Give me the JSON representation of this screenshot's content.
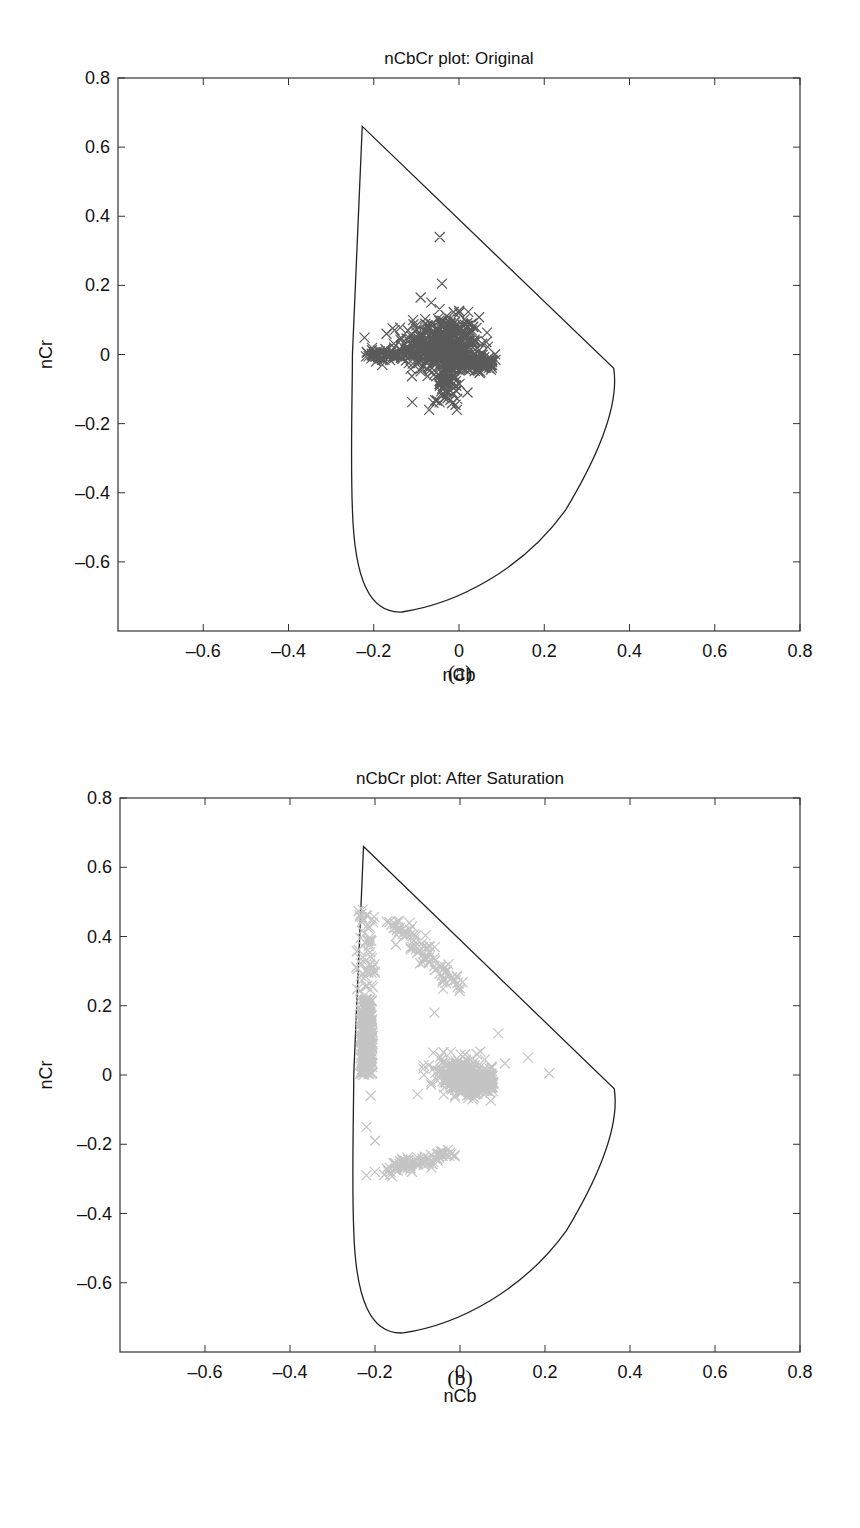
{
  "chart_data": [
    {
      "type": "scatter",
      "panel": "(a)",
      "title": "nCbCr plot: Original",
      "xlabel": "nCb",
      "ylabel": "nCr",
      "xlim": [
        -0.8,
        0.8
      ],
      "ylim": [
        -0.8,
        0.8
      ],
      "xticks": [
        "-0.6",
        "-0.4",
        "-0.2",
        "0",
        "0.2",
        "0.4",
        "0.6",
        "0.8"
      ],
      "yticks": [
        "0.8",
        "0.6",
        "0.4",
        "0.2",
        "0",
        "-0.2",
        "-0.4",
        "-0.6"
      ],
      "grid": false,
      "legend": null,
      "marker": "x",
      "marker_color": "#5a5a5a",
      "gamut_boundary": {
        "description": "closed gamut outline",
        "top_vertex": [
          -0.227,
          0.66
        ],
        "right_vertex": [
          0.363,
          -0.04
        ],
        "bottom": [
          -0.134,
          -0.745
        ],
        "left_edge_x_at_0": -0.25
      },
      "clusters": [
        {
          "name": "main-body",
          "cx": -0.04,
          "cy": 0.03,
          "sx": 0.045,
          "sy": 0.04,
          "n": 420
        },
        {
          "name": "horizontal-arm-left",
          "x_range": [
            -0.22,
            0.0
          ],
          "cy": 0.0,
          "sy": 0.01,
          "n": 120
        },
        {
          "name": "horizontal-arm-right",
          "x_range": [
            0.0,
            0.08
          ],
          "cy": -0.025,
          "sy": 0.012,
          "n": 110
        },
        {
          "name": "downward-stem",
          "cx": -0.03,
          "cy": -0.07,
          "sx": 0.015,
          "sy": 0.03,
          "n": 90
        }
      ],
      "outliers": [
        [
          -0.045,
          0.34
        ],
        [
          -0.04,
          0.205
        ],
        [
          -0.09,
          0.165
        ],
        [
          -0.065,
          0.15
        ],
        [
          -0.17,
          0.06
        ],
        [
          -0.2,
          0.0
        ],
        [
          -0.18,
          -0.03
        ],
        [
          -0.07,
          -0.16
        ],
        [
          -0.005,
          -0.16
        ],
        [
          -0.06,
          -0.14
        ],
        [
          0.02,
          -0.11
        ],
        [
          0.05,
          -0.05
        ],
        [
          0.03,
          0.09
        ],
        [
          0.0,
          0.12
        ]
      ]
    },
    {
      "type": "scatter",
      "panel": "(b)",
      "title": "nCbCr plot: After Saturation",
      "xlabel": "nCb",
      "ylabel": "nCr",
      "xlim": [
        -0.8,
        0.8
      ],
      "ylim": [
        -0.8,
        0.8
      ],
      "xticks": [
        "-0.6",
        "-0.4",
        "-0.2",
        "0",
        "0.2",
        "0.4",
        "0.6",
        "0.8"
      ],
      "yticks": [
        "0.8",
        "0.6",
        "0.4",
        "0.2",
        "0",
        "-0.2",
        "-0.4",
        "-0.6"
      ],
      "grid": false,
      "legend": null,
      "marker": "x",
      "marker_color": "#c4c4c4",
      "gamut_boundary": {
        "description": "closed gamut outline",
        "top_vertex": [
          -0.227,
          0.66
        ],
        "right_vertex": [
          0.363,
          -0.04
        ],
        "bottom": [
          -0.134,
          -0.745
        ],
        "left_edge_x_at_0": -0.25
      },
      "clusters": [
        {
          "name": "left-edge-band",
          "x_range": [
            -0.235,
            -0.205
          ],
          "y_range": [
            0.0,
            0.22
          ],
          "n": 260
        },
        {
          "name": "left-edge-upper",
          "x_range": [
            -0.245,
            -0.2
          ],
          "y_range": [
            0.22,
            0.48
          ],
          "n": 60
        },
        {
          "name": "upper-diagonal",
          "from": [
            -0.17,
            0.46
          ],
          "to": [
            -0.01,
            0.26
          ],
          "spread": 0.012,
          "n": 90
        },
        {
          "name": "central-blob",
          "cx": 0.0,
          "cy": 0.0,
          "sx": 0.03,
          "sy": 0.025,
          "n": 260
        },
        {
          "name": "central-blob-right",
          "x_range": [
            0.02,
            0.08
          ],
          "cy": -0.02,
          "sy": 0.018,
          "n": 120
        },
        {
          "name": "lower-diagonal",
          "from": [
            -0.18,
            -0.28
          ],
          "to": [
            -0.02,
            -0.225
          ],
          "spread": 0.008,
          "n": 90
        }
      ],
      "outliers": [
        [
          -0.22,
          -0.15
        ],
        [
          -0.2,
          -0.19
        ],
        [
          -0.22,
          -0.29
        ],
        [
          -0.2,
          -0.28
        ],
        [
          0.03,
          -0.07
        ],
        [
          0.04,
          0.06
        ],
        [
          0.09,
          0.12
        ],
        [
          0.16,
          0.05
        ],
        [
          0.21,
          0.005
        ],
        [
          -0.06,
          0.18
        ],
        [
          0.0,
          0.25
        ],
        [
          -0.23,
          0.07
        ],
        [
          -0.21,
          -0.06
        ]
      ]
    }
  ],
  "figures": [
    {
      "caption": "(a)"
    },
    {
      "caption": "(b)"
    }
  ]
}
